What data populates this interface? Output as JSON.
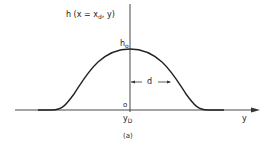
{
  "figure": {
    "ylabel_main": "h (x = x",
    "ylabel_sub": "d",
    "ylabel_tail": ", y)",
    "peak_label_main": "h",
    "peak_label_sub": "o",
    "origin_label": "o",
    "center_label_main": "y",
    "center_label_sub": "D",
    "width_label": "d",
    "xaxis_label": "y",
    "caption": "(a)"
  },
  "colors": {
    "line": "#222222",
    "background": "#ffffff"
  }
}
